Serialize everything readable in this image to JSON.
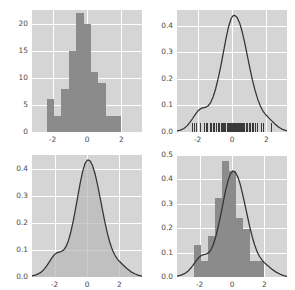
{
  "figure": {
    "background": "#ffffff",
    "axes_background": "#d5d5d5",
    "grid_color": "#ffffff",
    "bar_color": "#8b8b8b",
    "line_color": "#333333",
    "fill_color": "#b9b9b9",
    "rug_color": "#3a3a3a",
    "tick_color": "#4a4a4a",
    "layout": "2x2 grid of distribution plots"
  },
  "chart_data": [
    {
      "type": "bar",
      "panel": "top-left",
      "title": "",
      "xlabel": "",
      "ylabel": "",
      "description": "count histogram",
      "xlim": [
        -3.2,
        3.2
      ],
      "ylim": [
        0,
        22.5
      ],
      "xticks": [
        -2,
        0,
        2
      ],
      "xticklabels": [
        "-2",
        "0",
        "2"
      ],
      "yticks": [
        0,
        5,
        10,
        15,
        20
      ],
      "yticklabels": [
        "0",
        "5",
        "10",
        "15",
        "20"
      ],
      "grid": true,
      "bin_edges": [
        -2.35,
        -1.92,
        -1.49,
        -1.06,
        -0.63,
        -0.2,
        0.23,
        0.66,
        1.09,
        1.52,
        1.95,
        2.38
      ],
      "values": [
        6,
        3,
        8,
        15,
        22,
        20,
        11,
        9,
        3,
        3,
        0
      ],
      "categories": [
        "-2.35",
        "-1.92",
        "-1.49",
        "-1.06",
        "-0.63",
        "-0.20",
        "0.23",
        "0.66",
        "1.09",
        "1.52",
        "1.95"
      ]
    },
    {
      "type": "line",
      "panel": "top-right",
      "title": "",
      "xlabel": "",
      "ylabel": "",
      "description": "kernel density estimate with rug plot",
      "xlim": [
        -3.2,
        3.2
      ],
      "ylim": [
        0,
        0.46
      ],
      "xticks": [
        -2,
        0,
        2
      ],
      "xticklabels": [
        "-2",
        "0",
        "2"
      ],
      "yticks": [
        0.0,
        0.1,
        0.2,
        0.3,
        0.4
      ],
      "yticklabels": [
        "0.0",
        "0.1",
        "0.2",
        "0.3",
        "0.4"
      ],
      "grid": true,
      "series": [
        {
          "name": "kde",
          "x": [
            -3.2,
            -3.0,
            -2.8,
            -2.6,
            -2.45,
            -2.3,
            -2.15,
            -2.0,
            -1.85,
            -1.7,
            -1.55,
            -1.4,
            -1.25,
            -1.1,
            -0.95,
            -0.8,
            -0.65,
            -0.5,
            -0.35,
            -0.2,
            -0.05,
            0.05,
            0.15,
            0.3,
            0.45,
            0.6,
            0.75,
            0.9,
            1.05,
            1.2,
            1.35,
            1.5,
            1.65,
            1.8,
            1.95,
            2.1,
            2.3,
            2.5,
            2.7,
            2.9,
            3.2
          ],
          "values": [
            0.004,
            0.007,
            0.013,
            0.024,
            0.036,
            0.05,
            0.065,
            0.078,
            0.087,
            0.091,
            0.093,
            0.098,
            0.11,
            0.132,
            0.163,
            0.203,
            0.249,
            0.3,
            0.352,
            0.397,
            0.428,
            0.438,
            0.44,
            0.432,
            0.41,
            0.376,
            0.333,
            0.285,
            0.237,
            0.193,
            0.155,
            0.123,
            0.098,
            0.079,
            0.066,
            0.056,
            0.043,
            0.03,
            0.019,
            0.011,
            0.004
          ]
        }
      ],
      "rug": [
        -2.3,
        -2.22,
        -2.12,
        -1.85,
        -1.62,
        -1.5,
        -1.44,
        -1.3,
        -1.22,
        -1.1,
        -1.02,
        -0.92,
        -0.82,
        -0.74,
        -0.66,
        -0.58,
        -0.5,
        -0.44,
        -0.38,
        -0.32,
        -0.26,
        -0.2,
        -0.15,
        -0.1,
        -0.05,
        0.0,
        0.04,
        0.08,
        0.12,
        0.16,
        0.2,
        0.25,
        0.3,
        0.35,
        0.4,
        0.46,
        0.52,
        0.58,
        0.64,
        0.72,
        0.8,
        0.88,
        0.96,
        1.05,
        1.14,
        1.24,
        1.34,
        1.48,
        1.7,
        1.8,
        2.25
      ]
    },
    {
      "type": "area",
      "panel": "bottom-left",
      "title": "",
      "xlabel": "",
      "ylabel": "",
      "description": "shaded kernel density estimate",
      "xlim": [
        -3.4,
        3.4
      ],
      "ylim": [
        0,
        0.45
      ],
      "xticks": [
        -2,
        0,
        2
      ],
      "xticklabels": [
        "-2",
        "0",
        "2"
      ],
      "yticks": [
        0.0,
        0.1,
        0.2,
        0.3,
        0.4
      ],
      "yticklabels": [
        "0.0",
        "0.1",
        "0.2",
        "0.3",
        "0.4"
      ],
      "grid": true,
      "series": [
        {
          "name": "kde",
          "x": [
            -3.4,
            -3.15,
            -2.9,
            -2.7,
            -2.5,
            -2.35,
            -2.2,
            -2.05,
            -1.9,
            -1.75,
            -1.6,
            -1.45,
            -1.3,
            -1.15,
            -1.0,
            -0.85,
            -0.7,
            -0.55,
            -0.4,
            -0.25,
            -0.1,
            0.05,
            0.2,
            0.35,
            0.5,
            0.65,
            0.8,
            0.95,
            1.1,
            1.25,
            1.4,
            1.55,
            1.7,
            1.85,
            2.0,
            2.2,
            2.45,
            2.7,
            2.95,
            3.2,
            3.4
          ],
          "values": [
            0.004,
            0.008,
            0.015,
            0.025,
            0.04,
            0.054,
            0.068,
            0.08,
            0.088,
            0.092,
            0.094,
            0.099,
            0.112,
            0.134,
            0.166,
            0.207,
            0.254,
            0.304,
            0.353,
            0.394,
            0.422,
            0.432,
            0.428,
            0.41,
            0.38,
            0.341,
            0.296,
            0.249,
            0.204,
            0.164,
            0.13,
            0.103,
            0.083,
            0.069,
            0.058,
            0.046,
            0.032,
            0.02,
            0.012,
            0.006,
            0.003
          ]
        }
      ]
    },
    {
      "type": "bar",
      "panel": "bottom-right",
      "title": "",
      "xlabel": "",
      "ylabel": "",
      "description": "density histogram with kde overlay",
      "xlim": [
        -3.4,
        3.4
      ],
      "ylim": [
        0,
        0.5
      ],
      "xticks": [
        -2,
        0,
        2
      ],
      "xticklabels": [
        "-2",
        "0",
        "2"
      ],
      "yticks": [
        0.0,
        0.1,
        0.2,
        0.3,
        0.4,
        0.5
      ],
      "yticklabels": [
        "0.0",
        "0.1",
        "0.2",
        "0.3",
        "0.4",
        "0.5"
      ],
      "grid": true,
      "bin_edges": [
        -2.35,
        -1.92,
        -1.49,
        -1.06,
        -0.63,
        -0.2,
        0.23,
        0.66,
        1.09,
        1.52,
        1.95,
        2.38
      ],
      "values": [
        0.13,
        0.065,
        0.17,
        0.325,
        0.475,
        0.435,
        0.24,
        0.195,
        0.065,
        0.065,
        0.0
      ],
      "categories": [
        "-2.35",
        "-1.92",
        "-1.49",
        "-1.06",
        "-0.63",
        "-0.20",
        "0.23",
        "0.66",
        "1.09",
        "1.52",
        "1.95"
      ],
      "series": [
        {
          "name": "kde",
          "x": [
            -3.4,
            -3.15,
            -2.9,
            -2.7,
            -2.5,
            -2.35,
            -2.2,
            -2.05,
            -1.9,
            -1.75,
            -1.6,
            -1.45,
            -1.3,
            -1.15,
            -1.0,
            -0.85,
            -0.7,
            -0.55,
            -0.4,
            -0.25,
            -0.1,
            0.05,
            0.2,
            0.35,
            0.5,
            0.65,
            0.8,
            0.95,
            1.1,
            1.25,
            1.4,
            1.55,
            1.7,
            1.85,
            2.0,
            2.2,
            2.45,
            2.7,
            2.95,
            3.2,
            3.4
          ],
          "values": [
            0.004,
            0.008,
            0.015,
            0.025,
            0.04,
            0.054,
            0.068,
            0.08,
            0.088,
            0.092,
            0.094,
            0.099,
            0.112,
            0.134,
            0.166,
            0.207,
            0.254,
            0.304,
            0.353,
            0.394,
            0.422,
            0.435,
            0.43,
            0.412,
            0.382,
            0.342,
            0.297,
            0.25,
            0.205,
            0.165,
            0.131,
            0.104,
            0.084,
            0.07,
            0.059,
            0.047,
            0.033,
            0.021,
            0.012,
            0.006,
            0.003
          ]
        }
      ]
    }
  ]
}
